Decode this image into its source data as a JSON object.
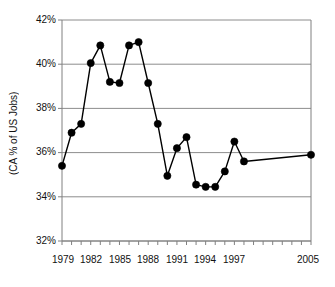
{
  "chart_data": {
    "type": "line",
    "title": "",
    "xlabel": "",
    "ylabel": "(CA % of US Jobs)",
    "ylim": [
      32,
      42
    ],
    "xlim": [
      1978,
      2006
    ],
    "grid": true,
    "legend": "none",
    "y_tick_labels": [
      "42%",
      "40%",
      "38%",
      "36%",
      "34%",
      "32%"
    ],
    "y_tick_values": [
      42,
      40,
      38,
      36,
      34,
      32
    ],
    "x_tick_labels": [
      "1979",
      "1982",
      "1985",
      "1988",
      "1991",
      "1994",
      "1997",
      "2005"
    ],
    "x_tick_values": [
      1979,
      1982,
      1985,
      1988,
      1991,
      1994,
      1997,
      2005
    ],
    "x": [
      1979,
      1980,
      1981,
      1982,
      1983,
      1984,
      1985,
      1986,
      1987,
      1988,
      1989,
      1990,
      1991,
      1992,
      1993,
      1994,
      1995,
      1996,
      1997,
      1998,
      2005
    ],
    "values": [
      35.4,
      36.9,
      37.3,
      40.05,
      40.85,
      39.2,
      39.15,
      40.85,
      41.0,
      39.15,
      37.3,
      34.95,
      36.2,
      36.7,
      34.55,
      34.45,
      34.45,
      35.15,
      36.5,
      35.6,
      35.9
    ],
    "series": [
      {
        "name": "CA % of US Jobs",
        "values": [
          35.4,
          36.9,
          37.3,
          40.05,
          40.85,
          39.2,
          39.15,
          40.85,
          41.0,
          39.15,
          37.3,
          34.95,
          36.2,
          36.7,
          34.55,
          34.45,
          34.45,
          35.15,
          36.5,
          35.6,
          35.9
        ],
        "color": "#000000",
        "marker": "filled-circle"
      }
    ],
    "colors": {
      "line": "#000000",
      "marker": "#000000",
      "grid": "#808080",
      "axis": "#808080",
      "background": "#ffffff"
    }
  }
}
